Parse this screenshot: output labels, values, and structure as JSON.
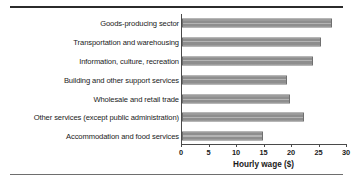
{
  "chart_data": {
    "type": "bar",
    "orientation": "horizontal",
    "title": "",
    "xlabel": "Hourly wage ($)",
    "ylabel": "",
    "xlim": [
      0,
      30
    ],
    "xticks": [
      0,
      5,
      10,
      15,
      20,
      25,
      30
    ],
    "grid": false,
    "legend": null,
    "bar_color": "#8e8e8e",
    "categories": [
      "Goods-producing sector",
      "Transportation and warehousing",
      "Information, culture, recreation",
      "Building and other support services",
      "Wholesale and retail trade",
      "Other services (except public administration)",
      "Accommodation and food services"
    ],
    "values": [
      27.3,
      25.2,
      23.8,
      19.1,
      19.7,
      22.2,
      14.8
    ]
  }
}
